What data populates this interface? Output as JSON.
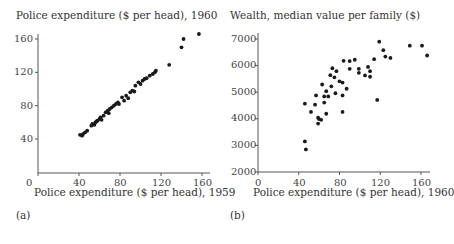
{
  "chart_data": [
    {
      "type": "scatter",
      "panel_label": "(a)",
      "title": "Police expenditure ($ per head), 1960",
      "xlabel": "Police expenditure ($ per head), 1959",
      "ylabel": "Police expenditure ($ per head), 1960",
      "xlim": [
        0,
        165
      ],
      "ylim": [
        10,
        170
      ],
      "xticks": [
        0,
        40,
        80,
        120,
        160
      ],
      "yticks": [
        40,
        80,
        120,
        160
      ],
      "grid": false,
      "points": [
        [
          41,
          45
        ],
        [
          44,
          46
        ],
        [
          43,
          44
        ],
        [
          46,
          48
        ],
        [
          52,
          56
        ],
        [
          53,
          58
        ],
        [
          55,
          57
        ],
        [
          56,
          60
        ],
        [
          58,
          62
        ],
        [
          60,
          64
        ],
        [
          62,
          63
        ],
        [
          61,
          66
        ],
        [
          64,
          68
        ],
        [
          66,
          72
        ],
        [
          68,
          74
        ],
        [
          69,
          71
        ],
        [
          70,
          76
        ],
        [
          72,
          78
        ],
        [
          74,
          80
        ],
        [
          76,
          82
        ],
        [
          78,
          84
        ],
        [
          79,
          82
        ],
        [
          82,
          90
        ],
        [
          84,
          86
        ],
        [
          86,
          92
        ],
        [
          90,
          96
        ],
        [
          92,
          98
        ],
        [
          94,
          97
        ],
        [
          95,
          104
        ],
        [
          98,
          108
        ],
        [
          100,
          106
        ],
        [
          102,
          110
        ],
        [
          104,
          112
        ],
        [
          106,
          113
        ],
        [
          109,
          116
        ],
        [
          112,
          118
        ],
        [
          114,
          120
        ],
        [
          115,
          122
        ],
        [
          128,
          129
        ],
        [
          140,
          150
        ],
        [
          142,
          160
        ],
        [
          157,
          166
        ],
        [
          88,
          89
        ],
        [
          48,
          50
        ],
        [
          57,
          61
        ]
      ]
    },
    {
      "type": "scatter",
      "panel_label": "(b)",
      "title": "Wealth, median value per family ($)",
      "xlabel": "Police expenditure ($ per head), 1960",
      "ylabel": "Wealth, median value per family ($)",
      "xlim": [
        0,
        170
      ],
      "ylim": [
        2000,
        7100
      ],
      "xticks": [
        0,
        40,
        80,
        120,
        160
      ],
      "yticks": [
        2000,
        3000,
        4000,
        5000,
        6000,
        7000
      ],
      "grid": false,
      "points": [
        [
          46,
          4570
        ],
        [
          52,
          4260
        ],
        [
          56,
          4530
        ],
        [
          57,
          4880
        ],
        [
          59,
          4040
        ],
        [
          63,
          5290
        ],
        [
          65,
          4610
        ],
        [
          65,
          4840
        ],
        [
          67,
          5040
        ],
        [
          69,
          4840
        ],
        [
          67,
          4190
        ],
        [
          71,
          5640
        ],
        [
          72,
          5220
        ],
        [
          73,
          5900
        ],
        [
          75,
          5560
        ],
        [
          77,
          5790
        ],
        [
          76,
          4960
        ],
        [
          80,
          5410
        ],
        [
          83,
          4260
        ],
        [
          83,
          5360
        ],
        [
          84,
          6180
        ],
        [
          83,
          4880
        ],
        [
          87,
          5130
        ],
        [
          90,
          6170
        ],
        [
          90,
          5880
        ],
        [
          95,
          6220
        ],
        [
          99,
          5880
        ],
        [
          99,
          5730
        ],
        [
          105,
          5630
        ],
        [
          108,
          5950
        ],
        [
          110,
          5790
        ],
        [
          110,
          5580
        ],
        [
          114,
          6240
        ],
        [
          117,
          4710
        ],
        [
          119,
          6900
        ],
        [
          123,
          6580
        ],
        [
          125,
          6340
        ],
        [
          130,
          6290
        ],
        [
          149,
          6750
        ],
        [
          161,
          6750
        ],
        [
          166,
          6380
        ],
        [
          62,
          3960
        ],
        [
          59,
          3820
        ],
        [
          60,
          3990
        ],
        [
          46,
          3150
        ],
        [
          47,
          2850
        ]
      ]
    }
  ],
  "panels": {
    "a": {
      "title": "Police expenditure ($ per head), 1960",
      "xlabel": "Police expenditure ($ per head), 1959",
      "label": "(a)",
      "xticks": [
        "0",
        "40",
        "80",
        "120",
        "160"
      ],
      "yticks": [
        "40",
        "80",
        "120",
        "160"
      ]
    },
    "b": {
      "title": "Wealth, median value per family ($)",
      "xlabel": "Police expenditure ($ per head), 1960",
      "label": "(b)",
      "xticks": [
        "0",
        "40",
        "80",
        "120",
        "160"
      ],
      "yticks": [
        "2000",
        "3000",
        "4000",
        "5000",
        "6000",
        "7000"
      ]
    }
  },
  "colors": {
    "point": "#1a1a1a",
    "axis": "#555555"
  }
}
